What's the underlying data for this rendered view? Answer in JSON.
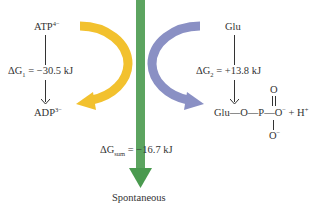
{
  "colors": {
    "atp_arrow": "#f2c12e",
    "glu_arrow": "#8a90c4",
    "sum_arrow": "#4a9a4f",
    "text": "#333333"
  },
  "reaction1": {
    "reactant": "ATP",
    "reactant_charge": "4−",
    "product": "ADP",
    "product_charge": "3−",
    "delta_g_symbol": "ΔG",
    "delta_g_sub": "1",
    "delta_g_value": "= −30.5 kJ"
  },
  "reaction2": {
    "reactant": "Glu",
    "delta_g_symbol": "ΔG",
    "delta_g_sub": "2",
    "delta_g_value": "= +13.8 kJ",
    "product_chain": "Glu—O—P—O",
    "product_top_o": "O",
    "product_bottom_o": "O",
    "minus": "−",
    "plus_h": "+ H",
    "h_charge": "+"
  },
  "sum": {
    "delta_g_symbol": "ΔG",
    "delta_g_sub": "sum",
    "delta_g_value": "= −16.7 kJ",
    "result_label": "Spontaneous"
  }
}
